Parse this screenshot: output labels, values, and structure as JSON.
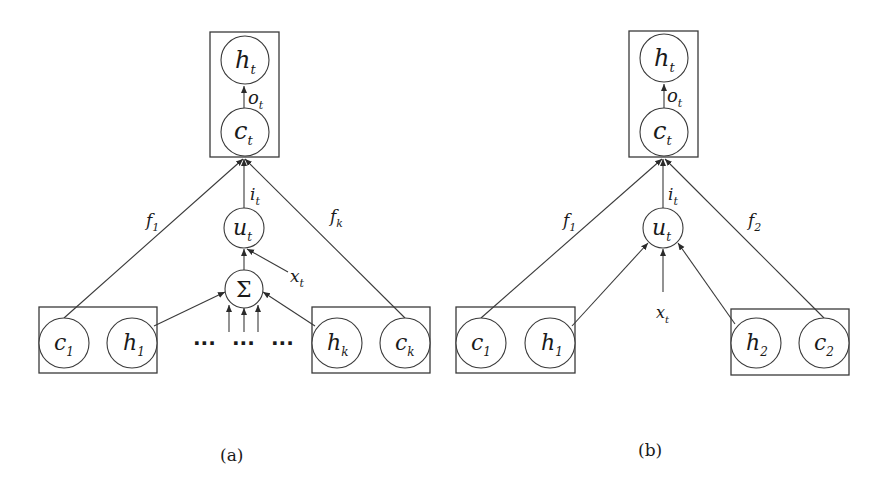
{
  "diagrams": [
    {
      "caption": "(a)",
      "top_nodes": {
        "h": {
          "base": "h",
          "sub": "t"
        },
        "c": {
          "base": "c",
          "sub": "t"
        }
      },
      "gate_labels": {
        "output": {
          "base": "o",
          "sub": "t"
        },
        "input": {
          "base": "i",
          "sub": "t"
        },
        "forget_left": {
          "base": "f",
          "sub": "1"
        },
        "forget_right": {
          "base": "f",
          "sub": "k"
        }
      },
      "update_node": {
        "base": "u",
        "sub": "t"
      },
      "sum_node": "Σ",
      "input_label": {
        "base": "x",
        "sub": "t"
      },
      "left_child": {
        "c": {
          "base": "c",
          "sub": "1"
        },
        "h": {
          "base": "h",
          "sub": "1"
        }
      },
      "right_child": {
        "h": {
          "base": "h",
          "sub": "k"
        },
        "c": {
          "base": "c",
          "sub": "k"
        }
      },
      "ellipsis": [
        "···",
        "···",
        "···"
      ]
    },
    {
      "caption": "(b)",
      "top_nodes": {
        "h": {
          "base": "h",
          "sub": "t"
        },
        "c": {
          "base": "c",
          "sub": "t"
        }
      },
      "gate_labels": {
        "output": {
          "base": "o",
          "sub": "t"
        },
        "input": {
          "base": "i",
          "sub": "t"
        },
        "forget_left": {
          "base": "f",
          "sub": "1"
        },
        "forget_right": {
          "base": "f",
          "sub": "2"
        }
      },
      "update_node": {
        "base": "u",
        "sub": "t"
      },
      "input_label": {
        "base": "x",
        "sub": "t"
      },
      "left_child": {
        "c": {
          "base": "c",
          "sub": "1"
        },
        "h": {
          "base": "h",
          "sub": "1"
        }
      },
      "right_child": {
        "h": {
          "base": "h",
          "sub": "2"
        },
        "c": {
          "base": "c",
          "sub": "2"
        }
      }
    }
  ],
  "colors": {
    "stroke": "#3a3a3a",
    "text": "#1a1a1a",
    "background": "#ffffff"
  }
}
